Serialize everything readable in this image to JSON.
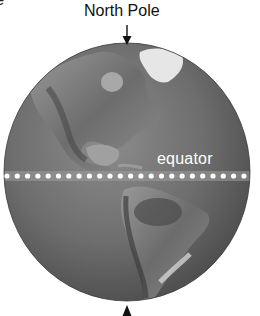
{
  "figure": {
    "top_fragment_text": "re",
    "north_label": "North Pole",
    "equator_label": "equator",
    "south_arrow_present": true
  },
  "globe": {
    "view": "Western Hemisphere",
    "continents": [
      "North America",
      "Greenland",
      "South America"
    ],
    "style": "grayscale relief"
  },
  "colors": {
    "ocean": "#6a6a6a",
    "land": "#8a8a8a",
    "ice": "#e6e6e6",
    "equator_dots": "#ffffff",
    "text": "#111111"
  }
}
